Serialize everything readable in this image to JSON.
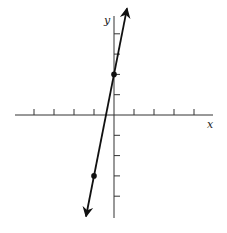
{
  "chart_data": {
    "type": "line",
    "title": "",
    "xlabel": "x",
    "ylabel": "y",
    "grid": false,
    "xlim": [
      -5,
      5
    ],
    "ylim": [
      -5,
      5
    ],
    "x_ticks": [
      -4,
      -3,
      -2,
      -1,
      1,
      2,
      3,
      4
    ],
    "y_ticks": [
      -4,
      -3,
      -2,
      -1,
      1,
      2,
      3,
      4
    ],
    "series": [
      {
        "name": "line",
        "equation": "y = 5x + 2",
        "slope": 5,
        "intercept": 2,
        "arrows_both_ends": true,
        "x_range": [
          -1.4,
          0.65
        ]
      }
    ],
    "points": [
      {
        "x": 0,
        "y": 2
      },
      {
        "x": -1,
        "y": -3
      }
    ]
  },
  "axes": {
    "x_label": "x",
    "y_label": "y"
  },
  "colors": {
    "line": "#111111",
    "axis": "#333333"
  }
}
